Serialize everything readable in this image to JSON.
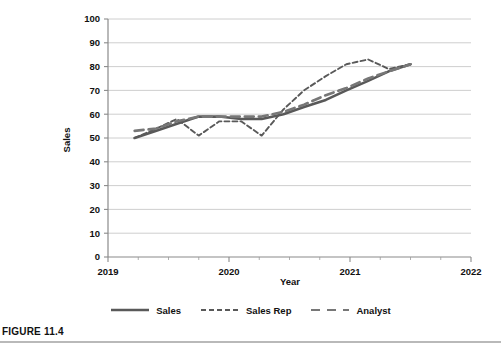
{
  "figure": {
    "caption": "FIGURE 11.4"
  },
  "chart_data": {
    "type": "line",
    "title": "",
    "xlabel": "Year",
    "ylabel": "Sales",
    "xlim": [
      2019,
      2022
    ],
    "ylim": [
      0,
      100
    ],
    "grid": true,
    "legend_position": "bottom",
    "xticks": [
      2019,
      2020,
      2021,
      2022
    ],
    "xtick_labels": [
      "2019",
      "2020",
      "2021",
      "2022"
    ],
    "xminor_ticks": [
      2019.25,
      2019.5,
      2019.75,
      2020.25,
      2020.5,
      2020.75,
      2021.25,
      2021.5,
      2021.75
    ],
    "yticks": [
      0,
      10,
      20,
      30,
      40,
      50,
      60,
      70,
      80,
      90,
      100
    ],
    "ytick_labels": [
      "0",
      "10",
      "20",
      "30",
      "40",
      "50",
      "60",
      "70",
      "80",
      "90",
      "100"
    ],
    "series": [
      {
        "name": "Sales",
        "style": "solid",
        "color": "#595959",
        "x": [
          2019.22,
          2019.4,
          2019.57,
          2019.75,
          2019.92,
          2020.1,
          2020.27,
          2020.45,
          2020.62,
          2020.8,
          2020.97,
          2021.15,
          2021.32,
          2021.5
        ],
        "values": [
          50,
          53,
          56,
          59,
          59,
          58,
          58,
          60,
          63,
          66,
          70,
          74,
          78,
          81
        ]
      },
      {
        "name": "Sales Rep",
        "style": "dashed-short",
        "color": "#595959",
        "x": [
          2019.22,
          2019.4,
          2019.57,
          2019.75,
          2019.92,
          2020.1,
          2020.27,
          2020.45,
          2020.62,
          2020.8,
          2020.97,
          2021.15,
          2021.32,
          2021.5
        ],
        "values": [
          50,
          54,
          58,
          51,
          57,
          57,
          51,
          62,
          70,
          76,
          81,
          83,
          79,
          81
        ]
      },
      {
        "name": "Analyst",
        "style": "dashed-long",
        "color": "#777777",
        "x": [
          2019.22,
          2019.4,
          2019.57,
          2019.75,
          2019.92,
          2020.1,
          2020.27,
          2020.45,
          2020.62,
          2020.8,
          2020.97,
          2021.15,
          2021.32,
          2021.5
        ],
        "values": [
          53,
          54,
          57,
          59,
          59,
          59,
          59,
          61,
          64,
          68,
          71,
          75,
          78,
          81
        ]
      }
    ],
    "legend": [
      {
        "label": "Sales",
        "style": "solid",
        "color": "#595959"
      },
      {
        "label": "Sales Rep",
        "style": "dashed-short",
        "color": "#595959"
      },
      {
        "label": "Analyst",
        "style": "dashed-long",
        "color": "#777777"
      }
    ]
  }
}
